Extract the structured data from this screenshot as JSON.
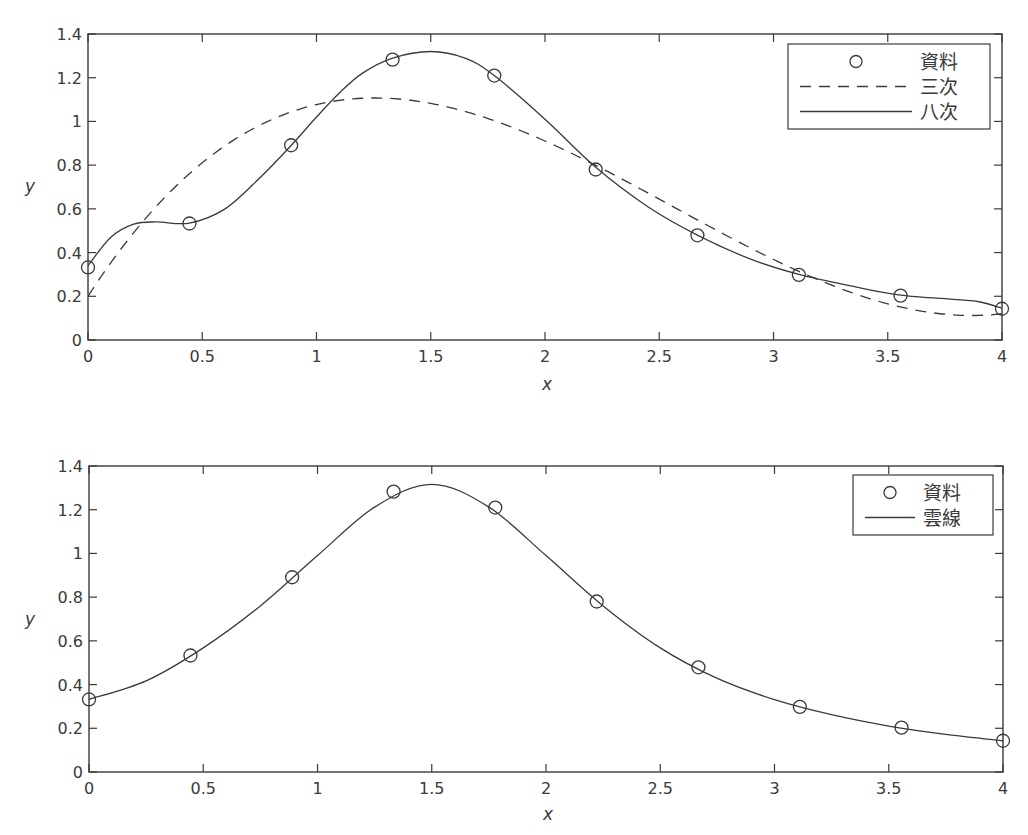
{
  "figure": {
    "width": 1028,
    "height": 835,
    "line_color": "#3a3a3a",
    "background": "#ffffff"
  },
  "chart_data": [
    {
      "type": "line",
      "id": "top",
      "title": "",
      "xlabel": "x",
      "ylabel": "y",
      "xlim": [
        0,
        4
      ],
      "ylim": [
        0,
        1.4
      ],
      "xticks": [
        0,
        0.5,
        1,
        1.5,
        2,
        2.5,
        3,
        3.5,
        4
      ],
      "xtick_labels": [
        "0",
        "0.5",
        "1",
        "1.5",
        "2",
        "2.5",
        "3",
        "3.5",
        "4"
      ],
      "yticks": [
        0,
        0.2,
        0.4,
        0.6,
        0.8,
        1,
        1.2,
        1.4
      ],
      "ytick_labels": [
        "0",
        "0.2",
        "0.4",
        "0.6",
        "0.8",
        "1",
        "1.2",
        "1.4"
      ],
      "grid": false,
      "legend_position": "upper right",
      "legend": [
        {
          "label": "資料",
          "style": "marker-circle"
        },
        {
          "label": "三次",
          "style": "dashed"
        },
        {
          "label": "八次",
          "style": "solid"
        }
      ],
      "series": [
        {
          "name": "資料",
          "kind": "markers",
          "x": [
            0,
            0.444,
            0.889,
            1.333,
            1.778,
            2.222,
            2.667,
            3.111,
            3.556,
            4
          ],
          "y": [
            0.332,
            0.533,
            0.891,
            1.283,
            1.21,
            0.78,
            0.479,
            0.298,
            0.203,
            0.143
          ]
        },
        {
          "name": "三次",
          "kind": "dashed",
          "polynomial_coefficients_ascending": [
            0.2,
            1.62212,
            -0.85637,
            0.11146
          ]
        },
        {
          "name": "八次",
          "kind": "solid",
          "x": [
            0,
            0.1,
            0.2,
            0.3,
            0.444,
            0.6,
            0.75,
            0.889,
            1.0,
            1.1,
            1.2,
            1.333,
            1.5,
            1.65,
            1.778,
            2.0,
            2.222,
            2.45,
            2.667,
            2.9,
            3.111,
            3.35,
            3.556,
            3.8,
            3.9,
            4.0
          ],
          "y": [
            0.34,
            0.47,
            0.53,
            0.54,
            0.535,
            0.6,
            0.74,
            0.89,
            1.02,
            1.13,
            1.22,
            1.29,
            1.32,
            1.29,
            1.21,
            1.01,
            0.79,
            0.61,
            0.48,
            0.37,
            0.3,
            0.245,
            0.205,
            0.185,
            0.175,
            0.145
          ]
        }
      ]
    },
    {
      "type": "line",
      "id": "bottom",
      "title": "",
      "xlabel": "x",
      "ylabel": "y",
      "xlim": [
        0,
        4
      ],
      "ylim": [
        0,
        1.4
      ],
      "xticks": [
        0,
        0.5,
        1,
        1.5,
        2,
        2.5,
        3,
        3.5,
        4
      ],
      "xtick_labels": [
        "0",
        "0.5",
        "1",
        "1.5",
        "2",
        "2.5",
        "3",
        "3.5",
        "4"
      ],
      "yticks": [
        0,
        0.2,
        0.4,
        0.6,
        0.8,
        1,
        1.2,
        1.4
      ],
      "ytick_labels": [
        "0",
        "0.2",
        "0.4",
        "0.6",
        "0.8",
        "1",
        "1.2",
        "1.4"
      ],
      "grid": false,
      "legend_position": "upper right",
      "legend": [
        {
          "label": "資料",
          "style": "marker-circle"
        },
        {
          "label": "雲線",
          "style": "solid"
        }
      ],
      "series": [
        {
          "name": "資料",
          "kind": "markers",
          "x": [
            0,
            0.444,
            0.889,
            1.333,
            1.778,
            2.222,
            2.667,
            3.111,
            3.556,
            4
          ],
          "y": [
            0.332,
            0.533,
            0.891,
            1.283,
            1.21,
            0.78,
            0.479,
            0.298,
            0.203,
            0.143
          ]
        },
        {
          "name": "雲線",
          "kind": "solid",
          "x": [
            0,
            0.25,
            0.5,
            0.75,
            1.0,
            1.25,
            1.5,
            1.75,
            2.0,
            2.25,
            2.5,
            2.75,
            3.0,
            3.25,
            3.5,
            3.75,
            4.0
          ],
          "y": [
            0.332,
            0.417,
            0.568,
            0.76,
            0.99,
            1.212,
            1.316,
            1.212,
            0.99,
            0.76,
            0.568,
            0.428,
            0.331,
            0.262,
            0.21,
            0.172,
            0.143
          ]
        }
      ]
    }
  ]
}
